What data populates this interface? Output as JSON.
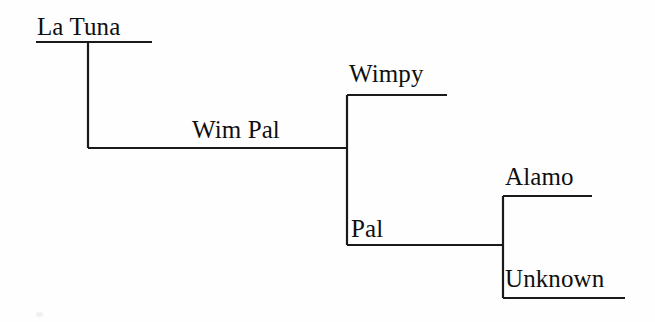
{
  "diagram": {
    "type": "cladogram",
    "title": "",
    "background_color": "#fefefe",
    "line_color": "#1a1a1a",
    "text_color": "#100f0f",
    "nodes": [
      {
        "id": "la-tuna",
        "label": "La Tuna",
        "role": "leaf",
        "depth": 1,
        "label_x": 37,
        "label_y": 14,
        "branch": {
          "x1": 36,
          "y1": 42,
          "x2": 152,
          "y2": 42
        }
      },
      {
        "id": "wim-pal",
        "label": "Wim Pal",
        "role": "internal",
        "depth": 2,
        "label_x": 192,
        "label_y": 117,
        "branch": {
          "x1": 88,
          "y1": 148,
          "x2": 347,
          "y2": 148
        }
      },
      {
        "id": "wimpy",
        "label": "Wimpy",
        "role": "leaf",
        "depth": 3,
        "label_x": 349,
        "label_y": 61,
        "branch": {
          "x1": 347,
          "y1": 95,
          "x2": 447,
          "y2": 95
        }
      },
      {
        "id": "pal",
        "label": "Pal",
        "role": "internal",
        "depth": 3,
        "label_x": 351,
        "label_y": 216,
        "branch": {
          "x1": 347,
          "y1": 245,
          "x2": 503,
          "y2": 245
        }
      },
      {
        "id": "alamo",
        "label": "Alamo",
        "role": "leaf",
        "depth": 4,
        "label_x": 505,
        "label_y": 164,
        "branch": {
          "x1": 503,
          "y1": 196,
          "x2": 592,
          "y2": 196
        }
      },
      {
        "id": "unknown",
        "label": "Unknown",
        "role": "leaf",
        "depth": 4,
        "label_x": 505,
        "label_y": 266,
        "branch": {
          "x1": 503,
          "y1": 298,
          "x2": 625,
          "y2": 298
        }
      }
    ],
    "connectors": [
      {
        "id": "root-to-wimpal",
        "x": 88,
        "y1": 42,
        "y2": 148
      },
      {
        "id": "wimpal-to-children",
        "x": 347,
        "y1": 95,
        "y2": 245
      },
      {
        "id": "pal-to-children",
        "x": 503,
        "y1": 196,
        "y2": 298
      }
    ]
  }
}
